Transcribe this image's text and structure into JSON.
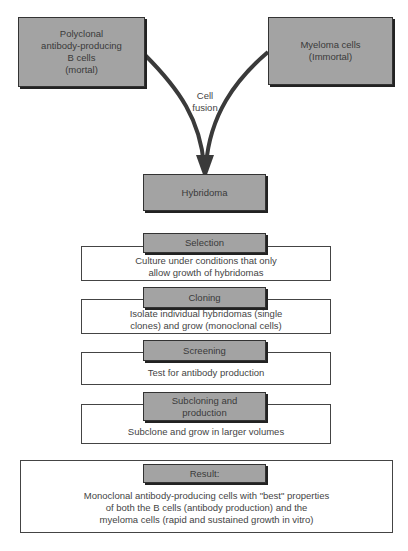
{
  "sources": {
    "left": {
      "label": "Polyclonal\nantibody-producing\nB cells\n(mortal)"
    },
    "right": {
      "label": "Myeloma cells\n(Immortal)"
    }
  },
  "fusion": {
    "label": "Cell\nfusion"
  },
  "hybridoma": {
    "label": "Hybridoma"
  },
  "steps": [
    {
      "title": "Selection",
      "description": "Culture under conditions that only\nallow growth of hybridomas"
    },
    {
      "title": "Cloning",
      "description": "Isolate individual hybridomas (single\nclones) and grow (monoclonal cells)"
    },
    {
      "title": "Screening",
      "description": "Test for antibody production"
    },
    {
      "title": "Subcloning and\nproduction",
      "description": "Subclone and grow in larger volumes"
    }
  ],
  "result": {
    "title": "Result:",
    "description": "Monoclonal antibody-producing cells with \"best\" properties\nof both the B cells (antibody production) and the\nmyeloma cells (rapid and sustained growth in vitro)"
  },
  "colors": {
    "box_fill": "#a3a3a3",
    "border": "#333333",
    "text": "#3a3a3a"
  }
}
